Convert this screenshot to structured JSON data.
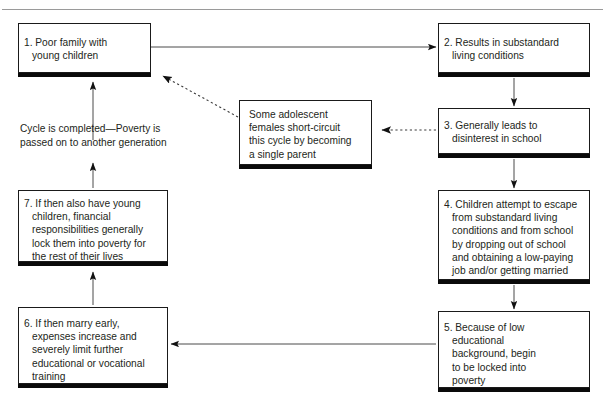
{
  "page": {
    "clipped_header_text": "",
    "background_color": "#ffffff",
    "line_color": "#1a1a1a",
    "text_color": "#231f20",
    "rule_color": "#9a9a9a"
  },
  "nodes": {
    "node1": {
      "label": "1. Poor family with\nyoung children",
      "x": 18,
      "y": 23,
      "w": 133,
      "h": 50
    },
    "node2": {
      "label": "2. Results in substandard\nliving conditions",
      "x": 438,
      "y": 23,
      "w": 152,
      "h": 50
    },
    "node3": {
      "label": "3. Generally leads to\ndisinterest in school",
      "x": 438,
      "y": 108,
      "w": 152,
      "h": 46
    },
    "node4": {
      "label": "4. Children attempt to escape\nfrom substandard living\nconditions and from school\nby dropping out of school\nand obtaining a low-paying\njob and/or getting married",
      "x": 438,
      "y": 190,
      "w": 152,
      "h": 90
    },
    "node5": {
      "label": "5. Because of low\neducational\nbackground, begin\nto be locked into\npoverty",
      "x": 438,
      "y": 311,
      "w": 152,
      "h": 77
    },
    "node6": {
      "label": "6. If then marry early,\nexpenses increase and\nseverely limit further\neducational or vocational\ntraining",
      "x": 18,
      "y": 307,
      "w": 150,
      "h": 77
    },
    "node7": {
      "label": "7. If then also have young\nchildren, financial\nresponsibilities generally\nlock them into poverty for\nthe rest of their lives",
      "x": 18,
      "y": 190,
      "w": 150,
      "h": 72
    },
    "node_adolescent": {
      "label": "Some adolescent\nfemales short-circuit\nthis cycle by becoming\na single parent",
      "x": 239,
      "y": 100,
      "w": 133,
      "h": 65
    }
  },
  "labels": {
    "cycle_completed": "Cycle is completed—Poverty is\npassed on to another generation"
  },
  "connectors": [
    {
      "name": "node1-to-node2",
      "style": "solid",
      "from": "node1",
      "to": "node2"
    },
    {
      "name": "node2-to-node3",
      "style": "solid",
      "from": "node2",
      "to": "node3"
    },
    {
      "name": "node3-to-node4",
      "style": "solid",
      "from": "node3",
      "to": "node4"
    },
    {
      "name": "node4-to-node5",
      "style": "solid",
      "from": "node4",
      "to": "node5"
    },
    {
      "name": "node5-to-node6",
      "style": "solid",
      "from": "node5",
      "to": "node6"
    },
    {
      "name": "node6-to-node7",
      "style": "solid",
      "from": "node6",
      "to": "node7"
    },
    {
      "name": "node7-to-node1",
      "style": "solid",
      "from": "node7",
      "to": "node1"
    },
    {
      "name": "node3-to-adolescent",
      "style": "dashed",
      "from": "node3",
      "to": "node_adolescent"
    },
    {
      "name": "adolescent-to-node1",
      "style": "dashed",
      "from": "node_adolescent",
      "to": "node1"
    }
  ]
}
